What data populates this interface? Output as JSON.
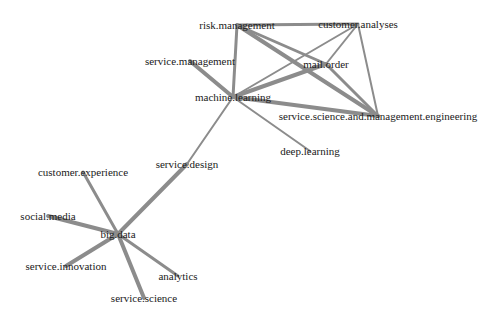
{
  "diagram": {
    "type": "network-graph",
    "edge_color": "#8c8c8c",
    "nodes": [
      {
        "id": "risk.management",
        "label": "risk.management",
        "x": 237,
        "y": 25
      },
      {
        "id": "customer.analyses",
        "label": "customer.analyses",
        "x": 358,
        "y": 24
      },
      {
        "id": "service.management",
        "label": "service.management",
        "x": 190,
        "y": 61
      },
      {
        "id": "mail.order",
        "label": "mail.order",
        "x": 326,
        "y": 64
      },
      {
        "id": "machine.learning",
        "label": "machine.learning",
        "x": 233,
        "y": 97
      },
      {
        "id": "service.science.and.management.engineering",
        "label": "service.science.and.management.engineering",
        "x": 378,
        "y": 116
      },
      {
        "id": "deep.learning",
        "label": "deep.learning",
        "x": 310,
        "y": 151
      },
      {
        "id": "service.design",
        "label": "service.design",
        "x": 187,
        "y": 164
      },
      {
        "id": "customer.experience",
        "label": "customer.experience",
        "x": 83,
        "y": 172
      },
      {
        "id": "social.media",
        "label": "social.media",
        "x": 48,
        "y": 216
      },
      {
        "id": "big.data",
        "label": "big.data",
        "x": 118,
        "y": 234
      },
      {
        "id": "service.innovation",
        "label": "service.innovation",
        "x": 66,
        "y": 266
      },
      {
        "id": "analytics",
        "label": "analytics",
        "x": 178,
        "y": 276
      },
      {
        "id": "service.science",
        "label": "service.science",
        "x": 144,
        "y": 298
      }
    ],
    "edges": [
      {
        "source": "risk.management",
        "target": "customer.analyses",
        "weight": 3
      },
      {
        "source": "risk.management",
        "target": "machine.learning",
        "weight": 3
      },
      {
        "source": "risk.management",
        "target": "mail.order",
        "weight": 3
      },
      {
        "source": "risk.management",
        "target": "service.science.and.management.engineering",
        "weight": 4
      },
      {
        "source": "customer.analyses",
        "target": "machine.learning",
        "weight": 2
      },
      {
        "source": "customer.analyses",
        "target": "mail.order",
        "weight": 2
      },
      {
        "source": "customer.analyses",
        "target": "service.science.and.management.engineering",
        "weight": 2
      },
      {
        "source": "mail.order",
        "target": "machine.learning",
        "weight": 4
      },
      {
        "source": "mail.order",
        "target": "service.science.and.management.engineering",
        "weight": 3
      },
      {
        "source": "service.management",
        "target": "machine.learning",
        "weight": 4
      },
      {
        "source": "machine.learning",
        "target": "service.science.and.management.engineering",
        "weight": 4
      },
      {
        "source": "machine.learning",
        "target": "deep.learning",
        "weight": 2
      },
      {
        "source": "machine.learning",
        "target": "service.design",
        "weight": 2
      },
      {
        "source": "service.design",
        "target": "big.data",
        "weight": 4
      },
      {
        "source": "customer.experience",
        "target": "big.data",
        "weight": 3
      },
      {
        "source": "social.media",
        "target": "big.data",
        "weight": 4
      },
      {
        "source": "service.innovation",
        "target": "big.data",
        "weight": 4
      },
      {
        "source": "analytics",
        "target": "big.data",
        "weight": 3
      },
      {
        "source": "service.science",
        "target": "big.data",
        "weight": 4
      }
    ]
  }
}
